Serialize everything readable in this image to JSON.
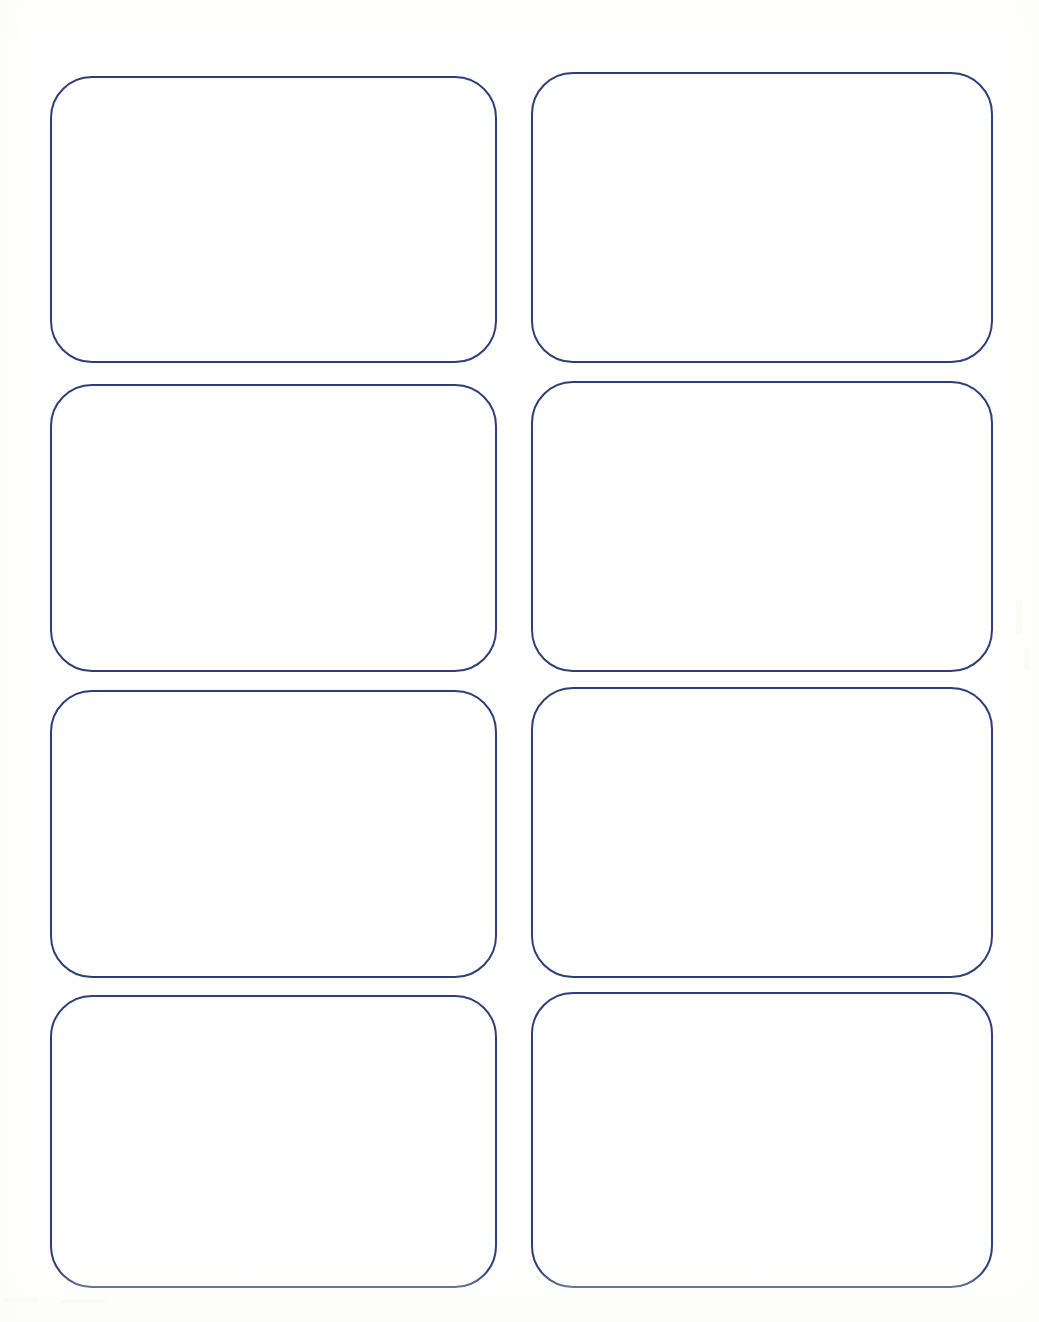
{
  "sheet": {
    "title": "Blank Card Template Sheet",
    "description": "Scanned blank template page with eight empty rounded-rectangle card outlines arranged in a two-column, four-row grid",
    "width": 1039,
    "height": 1322,
    "background_color": "#ffffff",
    "paper_tint_color": "#fcfcf8",
    "columns": 2,
    "rows": 4,
    "card_count": 8
  },
  "style": {
    "outline_color": "#2e3f77",
    "outline_width_px": 2,
    "corner_radius_px": 42,
    "card_fill_color": "#ffffff"
  },
  "cards": [
    {
      "id": "card-1",
      "position": "row-1-column-1",
      "row": 1,
      "column": 1,
      "content": "",
      "x": 50,
      "y": 76,
      "width": 447,
      "height": 287
    },
    {
      "id": "card-2",
      "position": "row-1-column-2",
      "row": 1,
      "column": 2,
      "content": "",
      "x": 531,
      "y": 72,
      "width": 462,
      "height": 291
    },
    {
      "id": "card-3",
      "position": "row-2-column-1",
      "row": 2,
      "column": 1,
      "content": "",
      "x": 50,
      "y": 384,
      "width": 447,
      "height": 288
    },
    {
      "id": "card-4",
      "position": "row-2-column-2",
      "row": 2,
      "column": 2,
      "content": "",
      "x": 531,
      "y": 381,
      "width": 462,
      "height": 291
    },
    {
      "id": "card-5",
      "position": "row-3-column-1",
      "row": 3,
      "column": 1,
      "content": "",
      "x": 50,
      "y": 690,
      "width": 447,
      "height": 288
    },
    {
      "id": "card-6",
      "position": "row-3-column-2",
      "row": 3,
      "column": 2,
      "content": "",
      "x": 531,
      "y": 687,
      "width": 462,
      "height": 291
    },
    {
      "id": "card-7",
      "position": "row-4-column-1",
      "row": 4,
      "column": 1,
      "content": "",
      "x": 50,
      "y": 995,
      "width": 447,
      "height": 293
    },
    {
      "id": "card-8",
      "position": "row-4-column-2",
      "row": 4,
      "column": 2,
      "content": "",
      "x": 531,
      "y": 992,
      "width": 462,
      "height": 296
    }
  ],
  "scan_artifacts": [
    {
      "x": 4,
      "y": 1298,
      "width": 34,
      "height": 4
    },
    {
      "x": 60,
      "y": 1300,
      "width": 46,
      "height": 3
    },
    {
      "x": 1016,
      "y": 600,
      "width": 6,
      "height": 34
    },
    {
      "x": 1024,
      "y": 648,
      "width": 5,
      "height": 22
    }
  ]
}
